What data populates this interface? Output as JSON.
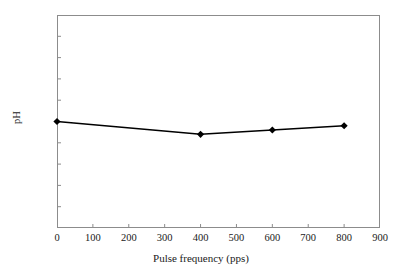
{
  "chart_data": {
    "type": "line",
    "title": "",
    "xlabel": "Pulse frequency (pps)",
    "ylabel": "pH",
    "x": [
      0,
      400,
      600,
      800
    ],
    "values": [
      3.75,
      3.72,
      3.73,
      3.74
    ],
    "series": [
      {
        "name": "pH",
        "x": [
          0,
          400,
          600,
          800
        ],
        "values": [
          3.75,
          3.72,
          3.73,
          3.74
        ]
      }
    ],
    "xlim": [
      0,
      900
    ],
    "ylim": [
      3.5,
      4
    ],
    "xticks": [
      0,
      100,
      200,
      300,
      400,
      500,
      600,
      700,
      800,
      900
    ],
    "xtick_labels": [
      "0",
      "100",
      "200",
      "300",
      "400",
      "500",
      "600",
      "700",
      "800",
      "900"
    ],
    "yticks": [
      3.5,
      3.55,
      3.6,
      3.65,
      3.7,
      3.75,
      3.8,
      3.85,
      3.9,
      3.95,
      4
    ],
    "ytick_labels": [
      "3.5",
      "3.55",
      "3.6",
      "3.65",
      "3.7",
      "3.75",
      "3.8",
      "3.85",
      "3.9",
      "3.95",
      "4"
    ],
    "grid": false,
    "legend": false,
    "marker": "diamond",
    "line_color": "#000000",
    "marker_color": "#000000",
    "frame_color": "#8c8c8c",
    "background_color": "#ffffff"
  }
}
